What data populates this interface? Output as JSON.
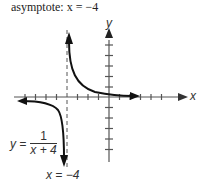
{
  "caption": "asymptote: x = −4",
  "labels": {
    "y_axis": "y",
    "x_axis": "x",
    "equation_lhs": "y =",
    "equation_num": "1",
    "equation_den": "x + 4",
    "asymptote_label": "x =  −4"
  },
  "colors": {
    "line": "#111111",
    "axis": "#444444",
    "text": "#333333"
  }
}
